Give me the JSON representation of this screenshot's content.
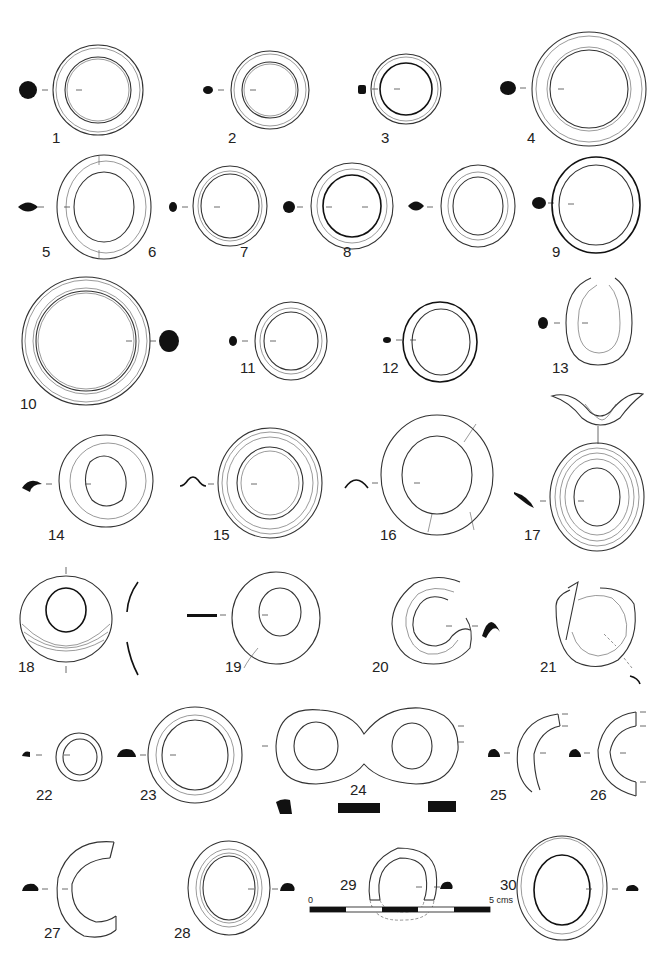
{
  "plate": {
    "type": "archaeological-illustration",
    "subject": "ring artefacts with cross-sections",
    "item_count": 30
  },
  "items": [
    {
      "n": "1",
      "label": "1"
    },
    {
      "n": "2",
      "label": "2"
    },
    {
      "n": "3",
      "label": "3"
    },
    {
      "n": "4",
      "label": "4"
    },
    {
      "n": "5",
      "label": "5"
    },
    {
      "n": "6",
      "label": "6"
    },
    {
      "n": "7",
      "label": "7"
    },
    {
      "n": "8",
      "label": "8"
    },
    {
      "n": "9",
      "label": "9"
    },
    {
      "n": "10",
      "label": "10"
    },
    {
      "n": "11",
      "label": "11"
    },
    {
      "n": "12",
      "label": "12"
    },
    {
      "n": "13",
      "label": "13"
    },
    {
      "n": "14",
      "label": "14"
    },
    {
      "n": "15",
      "label": "15"
    },
    {
      "n": "16",
      "label": "16"
    },
    {
      "n": "17",
      "label": "17"
    },
    {
      "n": "18",
      "label": "18"
    },
    {
      "n": "19",
      "label": "19"
    },
    {
      "n": "20",
      "label": "20"
    },
    {
      "n": "21",
      "label": "21"
    },
    {
      "n": "22",
      "label": "22"
    },
    {
      "n": "23",
      "label": "23"
    },
    {
      "n": "24",
      "label": "24"
    },
    {
      "n": "25",
      "label": "25"
    },
    {
      "n": "26",
      "label": "26"
    },
    {
      "n": "27",
      "label": "27"
    },
    {
      "n": "28",
      "label": "28"
    },
    {
      "n": "29",
      "label": "29"
    },
    {
      "n": "30",
      "label": "30"
    }
  ],
  "scale_bar": {
    "start_label": "0",
    "end_label": "5 cms",
    "segments": 5
  },
  "colors": {
    "ink": "#111111",
    "background": "#ffffff"
  }
}
